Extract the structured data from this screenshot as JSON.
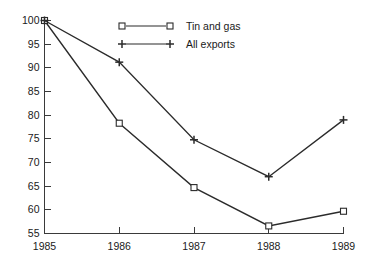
{
  "chart_data": {
    "type": "line",
    "title": "",
    "subtitle": "",
    "xlabel": "",
    "ylabel": "",
    "categories": [
      "1985",
      "1986",
      "1987",
      "1988",
      "1989"
    ],
    "x": [
      1985,
      1986,
      1987,
      1988,
      1989
    ],
    "xlim": [
      1985,
      1989
    ],
    "ylim": [
      55,
      100
    ],
    "yticks": [
      55,
      60,
      65,
      70,
      75,
      80,
      85,
      90,
      95,
      100
    ],
    "ytick_labels": [
      "55",
      "60",
      "65",
      "70",
      "75",
      "80",
      "85",
      "90",
      "95",
      "100"
    ],
    "xticks": [
      1985,
      1986,
      1987,
      1988,
      1989
    ],
    "xtick_labels": [
      "1985",
      "1986",
      "1987",
      "1988",
      "1989"
    ],
    "grid": false,
    "legend_position": "top-center",
    "series": [
      {
        "name": "Tin and gas",
        "marker": "open-square",
        "color": "#2b2b2b",
        "values": [
          100,
          78.3,
          64.7,
          56.6,
          59.7
        ]
      },
      {
        "name": "All exports",
        "marker": "plus",
        "color": "#2b2b2b",
        "values": [
          100,
          91.2,
          74.8,
          67.0,
          79.0
        ]
      }
    ]
  },
  "legend": {
    "entries": [
      {
        "label": "Tin and gas",
        "marker": "open-square"
      },
      {
        "label": "All exports",
        "marker": "plus"
      }
    ]
  },
  "axis": {
    "y_labels": [
      "100",
      "95",
      "90",
      "85",
      "80",
      "75",
      "70",
      "65",
      "60",
      "55"
    ],
    "x_labels": [
      "1985",
      "1986",
      "1987",
      "1988",
      "1989"
    ]
  },
  "colors": {
    "background": "#ffffff",
    "axis": "#3a3a3a",
    "line": "#2b2b2b",
    "text": "#1a1a1a"
  }
}
